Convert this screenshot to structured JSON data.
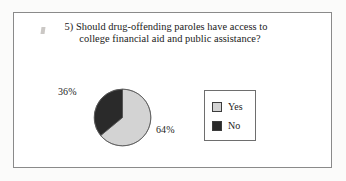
{
  "figure": {
    "question_number": "5)",
    "question_line_1": "5) Should drug-offending paroles have access to",
    "question_line_2": "college financial aid and public assistance?"
  },
  "colors": {
    "yes_fill": "#d3d3d3",
    "no_fill": "#2a2a2a",
    "slice_stroke": "#555555",
    "frame_border": "#8a8a8a",
    "legend_border": "#6e6e6e",
    "text": "#1a1a1a",
    "page_background": "#fbfbfa"
  },
  "labels": {
    "no_percent": "36%",
    "yes_percent": "64%"
  },
  "legend": {
    "items": [
      {
        "label": "Yes",
        "color": "#d3d3d3"
      },
      {
        "label": "No",
        "color": "#2a2a2a"
      }
    ]
  },
  "chart_data": {
    "type": "pie",
    "title": "5) Should drug-offending paroles have access to college financial aid and public assistance?",
    "categories": [
      "Yes",
      "No"
    ],
    "values": [
      64,
      36
    ],
    "value_labels": [
      "64%",
      "36%"
    ],
    "unit": "percent",
    "colors": [
      "#d3d3d3",
      "#2a2a2a"
    ],
    "start_angle_deg": 0,
    "direction": "clockwise",
    "legend_position": "right",
    "grid": false,
    "xlabel": "",
    "ylabel": ""
  }
}
